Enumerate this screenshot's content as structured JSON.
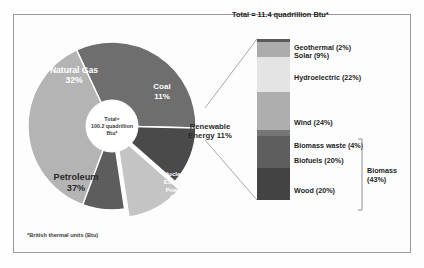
{
  "figure": {
    "footnote": "*British thermal units (Btu)",
    "pie_center_line1": "Total=",
    "pie_center_line2": "100.2 quadrillion",
    "pie_center_line3": "Btu*",
    "bar_title": "Total = 11.4 quadrillion Btu*"
  },
  "chart_data": {
    "type": "pie",
    "total_label": "Total= 100.2 quadrillion Btu*",
    "total_value": 100.2,
    "units": "quadrillion Btu",
    "categories": [
      "Petroleum",
      "Natural Gas",
      "Coal",
      "Renewable Energy",
      "Nuclear Electric Power"
    ],
    "values": [
      37,
      32,
      11,
      11,
      8
    ],
    "slices": [
      {
        "label": "Natural Gas",
        "value_label": "32%",
        "value": 32,
        "color": "#6e6e6e",
        "text_color": "#ffffff",
        "exploded": false
      },
      {
        "label": "Coal",
        "value_label": "11%",
        "value": 11,
        "color": "#4a4a4a",
        "text_color": "#ffffff",
        "exploded": false
      },
      {
        "label": "Renewable",
        "label2": "Energy 11%",
        "value_label": "11%",
        "value": 11,
        "color": "#c4c4c4",
        "text_color": "#2b2b2b",
        "exploded": true
      },
      {
        "label": "Nuclear",
        "label2": "Electric",
        "label3": "Power",
        "value_label": "8%",
        "value": 8,
        "color": "#5d5d5d",
        "text_color": "#ffffff",
        "exploded": false
      },
      {
        "label": "Petroleum",
        "value_label": "37%",
        "value": 37,
        "color": "#b4b4b4",
        "text_color": "#2b2b2b",
        "exploded": false
      }
    ],
    "legend": false,
    "grid": false
  },
  "chart_data_bar": {
    "type": "bar",
    "subtype": "stacked-single-column",
    "title": "Total = 11.4 quadrillion Btu*",
    "total_value": 11.4,
    "units": "quadrillion Btu",
    "categories": [
      "Geothermal",
      "Solar",
      "Hydroelectric",
      "Wind",
      "Biomass waste",
      "Biofuels",
      "Wood"
    ],
    "values": [
      2,
      9,
      22,
      24,
      4,
      20,
      20
    ],
    "segments": [
      {
        "label": "Geothermal (2%)",
        "name": "Geothermal",
        "value": 2,
        "color": "#5a5a5a"
      },
      {
        "label": "Solar (9%)",
        "name": "Solar",
        "value": 9,
        "color": "#acacac"
      },
      {
        "label": "Hydroelectric (22%)",
        "name": "Hydroelectric",
        "value": 22,
        "color": "#e4e4e4"
      },
      {
        "label": "Wind (24%)",
        "name": "Wind",
        "value": 24,
        "color": "#aeaeae"
      },
      {
        "label": "Biomass waste (4%)",
        "name": "Biomass waste",
        "value": 4,
        "color": "#767676"
      },
      {
        "label": "Biofuels (20%)",
        "name": "Biofuels",
        "value": 20,
        "color": "#5e5e5e"
      },
      {
        "label": "Wood (20%)",
        "name": "Wood",
        "value": 20,
        "color": "#434343"
      }
    ],
    "bracket": {
      "label_line1": "Biomass",
      "label_line2": "(43%)",
      "value": 43,
      "covers": [
        "Biomass waste",
        "Biofuels",
        "Wood"
      ]
    },
    "ylim": [
      0,
      100
    ],
    "ylabel": "",
    "xlabel": "",
    "grid": false,
    "legend": false
  }
}
